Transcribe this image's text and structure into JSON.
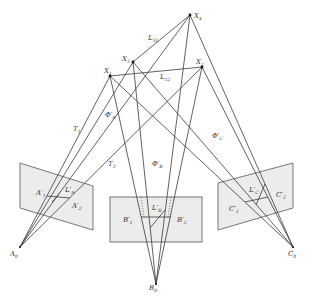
{
  "diagram": {
    "points": {
      "X4": {
        "label": "X",
        "sub": "4"
      },
      "X3": {
        "label": "X",
        "sub": "3"
      },
      "X2": {
        "label": "X",
        "sub": "2"
      },
      "X1": {
        "label": "X",
        "sub": "1"
      },
      "A0": {
        "label": "A",
        "sub": "0"
      },
      "B0": {
        "label": "B",
        "sub": "0"
      },
      "C0": {
        "label": "C",
        "sub": "0"
      }
    },
    "lines": {
      "L31": {
        "label": "L",
        "sub": "31"
      },
      "L12": {
        "label": "L",
        "sub": "12"
      },
      "T1": {
        "label": "T",
        "sub": "1"
      },
      "T3": {
        "label": "T",
        "sub": "3"
      }
    },
    "planes": {
      "PhiA": {
        "label": "Φ′",
        "sub": "A"
      },
      "PhiB": {
        "label": "Φ′",
        "sub": "B"
      },
      "PhiC": {
        "label": "Φ′",
        "sub": "C"
      }
    },
    "image_points": {
      "A1": {
        "label": "A′",
        "sub": "1"
      },
      "A2": {
        "label": "A′",
        "sub": "2"
      },
      "LA": {
        "label": "L′",
        "sub": "A"
      },
      "B1": {
        "label": "B′",
        "sub": "1"
      },
      "B2": {
        "label": "B′",
        "sub": "2"
      },
      "LB": {
        "label": "L′",
        "sub": "B"
      },
      "C1": {
        "label": "C′",
        "sub": "1"
      },
      "C2": {
        "label": "C′",
        "sub": "2"
      },
      "LC": {
        "label": "L′",
        "sub": "C"
      }
    }
  }
}
